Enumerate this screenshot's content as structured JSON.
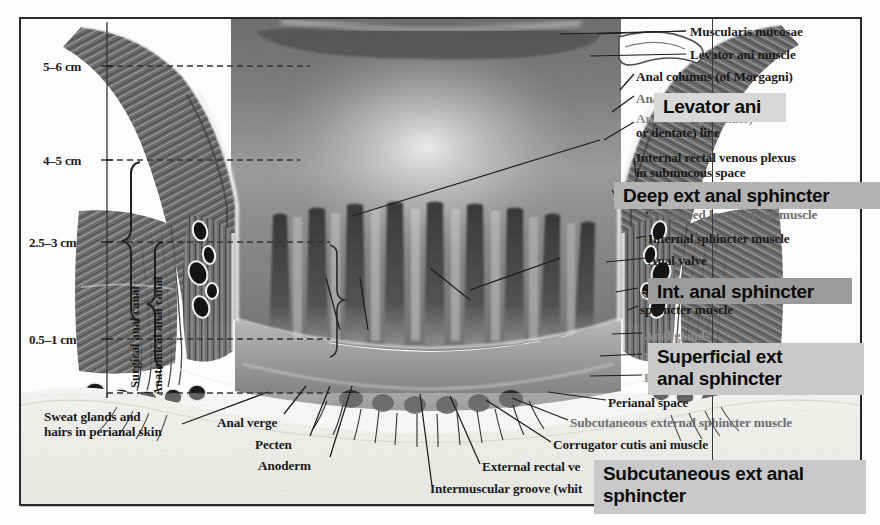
{
  "figure": {
    "kind": "anatomical-illustration",
    "colors": {
      "frame": "#2b2b2b",
      "chip_light": "#d8d8d8",
      "chip_medium": "#b3b3b3",
      "chip_dark": "#9b9b9b",
      "text": "#1a1a1a",
      "leader_line": "#1c1c1c"
    }
  },
  "scale": {
    "items": [
      {
        "text": "5–6 cm",
        "x": 43,
        "y": 60
      },
      {
        "text": "4–5 cm",
        "x": 43,
        "y": 154
      },
      {
        "text": "2.5–3 cm",
        "x": 31,
        "y": 236
      },
      {
        "text": "0.5–1 cm",
        "x": 31,
        "y": 333
      }
    ],
    "brackets": [
      {
        "label": "Surgical anal canal",
        "x": 110,
        "y": 190,
        "height": 200
      },
      {
        "label": "Anatomical anal canal",
        "x": 133,
        "y": 210,
        "height": 175
      }
    ]
  },
  "callouts": [
    {
      "id": "muscularis-mucosae",
      "text": "Muscularis mucosae",
      "x": 690,
      "y": 27,
      "state": "normal"
    },
    {
      "id": "levator-ani-muscle",
      "text": "Levator ani muscle",
      "x": 690,
      "y": 50,
      "state": "normal"
    },
    {
      "id": "anal-columns",
      "text": "Anal columns (of Morgagni)",
      "x": 636,
      "y": 72,
      "state": "normal"
    },
    {
      "id": "anal-sinus",
      "text": "Anal sinus",
      "x": 636,
      "y": 94,
      "state": "faded"
    },
    {
      "id": "anorectal-line-1",
      "text": "Anorectal (pectinate)",
      "x": 636,
      "y": 114,
      "state": "faded2"
    },
    {
      "id": "anorectal-line-2",
      "text": "or dentate) line",
      "x": 636,
      "y": 128,
      "state": "normal"
    },
    {
      "id": "internal-rectal-plexus-1",
      "text": "Internal rectal venous plexus",
      "x": 636,
      "y": 153,
      "state": "normal"
    },
    {
      "id": "internal-rectal-plexus-2",
      "text": "in submucous space",
      "x": 636,
      "y": 168,
      "state": "normal"
    },
    {
      "id": "conjoined-longitudinal",
      "text": "Conjoined longitudinal muscle",
      "x": 648,
      "y": 210,
      "state": "faded"
    },
    {
      "id": "internal-sphincter-muscle",
      "text": "Internal sphincter muscle",
      "x": 648,
      "y": 234,
      "state": "normal"
    },
    {
      "id": "anal-valve",
      "text": "Anal valve",
      "x": 648,
      "y": 256,
      "state": "normal"
    },
    {
      "id": "superficial-ext-1",
      "text": "Superficial external",
      "x": 640,
      "y": 290,
      "state": "faded2"
    },
    {
      "id": "superficial-ext-2",
      "text": "sphincter muscle",
      "x": 640,
      "y": 305,
      "state": "normal"
    },
    {
      "id": "anal-glands",
      "text": "Anal glands",
      "x": 644,
      "y": 331,
      "state": "faded2"
    },
    {
      "id": "intersphincteric-groove",
      "text": "I",
      "x": 644,
      "y": 352,
      "state": "faded2"
    },
    {
      "id": "perianal-area",
      "text": "P",
      "x": 644,
      "y": 373,
      "state": "faded2"
    },
    {
      "id": "perianal-space",
      "text": "Perianal space",
      "x": 608,
      "y": 398,
      "state": "normal"
    },
    {
      "id": "subcutaneous-ext-sphincter",
      "text": "Subcutaneous external sphincter muscle",
      "x": 570,
      "y": 418,
      "state": "faded"
    },
    {
      "id": "corrugator-cutis-ani",
      "text": "Corrugator cutis ani muscle",
      "x": 553,
      "y": 440,
      "state": "normal"
    },
    {
      "id": "external-rectal-venous",
      "text": "External rectal ve",
      "x": 482,
      "y": 462,
      "state": "normal"
    },
    {
      "id": "intermuscular-groove",
      "text": "Intermuscular groove (whit",
      "x": 430,
      "y": 484,
      "state": "normal"
    },
    {
      "id": "sweat-glands-1",
      "text": "Sweat glands and",
      "x": 44,
      "y": 412,
      "state": "normal"
    },
    {
      "id": "sweat-glands-2",
      "text": "hairs in perianal skin",
      "x": 44,
      "y": 427,
      "state": "normal"
    },
    {
      "id": "anal-verge",
      "text": "Anal verge",
      "x": 217,
      "y": 418,
      "state": "normal"
    },
    {
      "id": "pecten",
      "text": "Pecten",
      "x": 255,
      "y": 440,
      "state": "normal"
    },
    {
      "id": "anoderm",
      "text": "Anoderm",
      "x": 258,
      "y": 461,
      "state": "normal"
    }
  ],
  "annotations": [
    {
      "id": "levator-ani",
      "text": "Levator ani",
      "x": 654,
      "y": 93,
      "width": 132,
      "height": 29,
      "font_size": 19,
      "bg": "#d8d8d8"
    },
    {
      "id": "deep-ext-anal-sphincter",
      "text": "Deep  ext anal sphincter",
      "x": 614,
      "y": 182,
      "width": 266,
      "height": 27,
      "font_size": 19,
      "bg": "#b3b3b3"
    },
    {
      "id": "int-anal-sphincter",
      "text": "Int. anal sphincter",
      "x": 648,
      "y": 278,
      "width": 204,
      "height": 26,
      "font_size": 19,
      "bg": "#9b9b9b"
    },
    {
      "id": "superficial-ext-anal-sphincter",
      "text": "Superficial ext\nanal sphincter",
      "x": 648,
      "y": 343,
      "width": 216,
      "height": 52,
      "font_size": 19,
      "bg": "#c9c9c9"
    },
    {
      "id": "subcutaneous-ext-anal-sphincter",
      "text": "Subcutaneous ext anal\nsphincter",
      "x": 594,
      "y": 460,
      "width": 272,
      "height": 54,
      "font_size": 19,
      "bg": "#c9c9c9"
    }
  ]
}
